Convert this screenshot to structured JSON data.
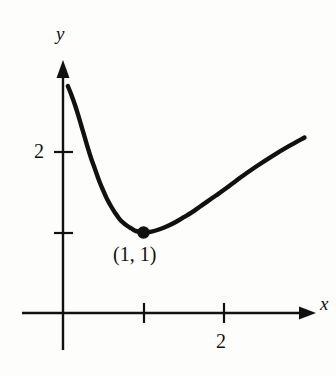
{
  "figure": {
    "background_color": "#fdfdfb",
    "ink_color": "#111111",
    "width": 336,
    "height": 376
  },
  "axes": {
    "x_label": "x",
    "y_label": "y",
    "x_tick_labels": [
      "2"
    ],
    "y_tick_labels": [
      "2"
    ]
  },
  "annotations": {
    "minimum_point_label": "(1, 1)"
  },
  "chart_data": {
    "type": "line",
    "title": "",
    "xlabel": "x",
    "ylabel": "y",
    "grid": false,
    "legend": null,
    "xlim": [
      -0.5,
      3.2
    ],
    "ylim": [
      -0.45,
      3.1
    ],
    "x_ticks": [
      1,
      2
    ],
    "x_tick_labels": [
      "",
      "2"
    ],
    "y_ticks": [
      1,
      2
    ],
    "y_tick_labels": [
      "",
      "2"
    ],
    "series": [
      {
        "name": "curve",
        "x": [
          0.06,
          0.1,
          0.15,
          0.2,
          0.25,
          0.3,
          0.35,
          0.4,
          0.45,
          0.5,
          0.55,
          0.6,
          0.65,
          0.7,
          0.75,
          0.8,
          0.85,
          0.9,
          0.95,
          1.0,
          1.1,
          1.2,
          1.3,
          1.4,
          1.5,
          1.6,
          1.7,
          1.8,
          1.9,
          2.0,
          2.2,
          2.4,
          2.6,
          2.8,
          3.0
        ],
        "y": [
          2.82,
          2.72,
          2.58,
          2.42,
          2.25,
          2.08,
          1.92,
          1.78,
          1.64,
          1.52,
          1.41,
          1.32,
          1.24,
          1.17,
          1.12,
          1.08,
          1.05,
          1.02,
          1.01,
          1.0,
          1.01,
          1.04,
          1.08,
          1.13,
          1.19,
          1.25,
          1.32,
          1.39,
          1.46,
          1.53,
          1.68,
          1.82,
          1.95,
          2.07,
          2.18
        ]
      }
    ],
    "points": [
      {
        "label": "(1, 1)",
        "x": 1,
        "y": 1,
        "marker": "filled-circle"
      }
    ],
    "annotations": [
      {
        "text": "(1, 1)",
        "x": 1,
        "y": 0.85
      }
    ]
  }
}
